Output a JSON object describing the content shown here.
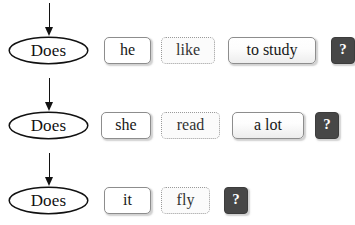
{
  "diagram": {
    "colors": {
      "ink": "#111111",
      "tile_border": "#8d8d8d",
      "dotted_border": "#9a9a9a",
      "dark_tile_bg": "#474747",
      "dark_tile_text": "#ffffff",
      "background": "#ffffff"
    },
    "rows": [
      {
        "auxiliary": "Does",
        "tiles": [
          {
            "text": "he",
            "style": "solid-plain",
            "x": 104,
            "width": 47
          },
          {
            "text": "like",
            "style": "dotted",
            "x": 161,
            "width": 54
          },
          {
            "text": "to study",
            "style": "solid-grad",
            "x": 228,
            "width": 88
          },
          {
            "text": "?",
            "style": "dark",
            "x": 331,
            "width": 24
          }
        ]
      },
      {
        "auxiliary": "Does",
        "tiles": [
          {
            "text": "she",
            "style": "solid-plain",
            "x": 101,
            "width": 50
          },
          {
            "text": "read",
            "style": "dotted",
            "x": 161,
            "width": 59
          },
          {
            "text": "a lot",
            "style": "solid-grad",
            "x": 232,
            "width": 72
          },
          {
            "text": "?",
            "style": "dark",
            "x": 315,
            "width": 24
          }
        ]
      },
      {
        "auxiliary": "Does",
        "tiles": [
          {
            "text": "it",
            "style": "solid-plain",
            "x": 104,
            "width": 47
          },
          {
            "text": "fly",
            "style": "dotted",
            "x": 161,
            "width": 49
          },
          {
            "text": "?",
            "style": "dark",
            "x": 224,
            "width": 24
          }
        ]
      }
    ]
  }
}
